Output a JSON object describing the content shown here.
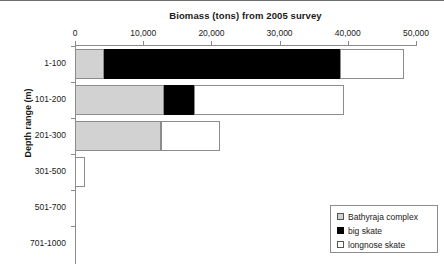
{
  "chart_data": {
    "type": "bar",
    "orientation": "horizontal",
    "stacked": true,
    "title": "Biomass (tons) from 2005 survey",
    "xlabel": "",
    "ylabel": "Depth range (m)",
    "categories": [
      "1-100",
      "101-200",
      "201-300",
      "301-500",
      "501-700",
      "701-1000"
    ],
    "xlim": [
      0,
      50000
    ],
    "xticks": [
      0,
      10000,
      20000,
      30000,
      40000,
      50000
    ],
    "xtick_labels": [
      "0",
      "10,000",
      "20,000",
      "30,000",
      "40,000",
      "50,000"
    ],
    "grid": false,
    "legend_position": "bottom-right",
    "series": [
      {
        "name": "Bathyraja complex",
        "color": "#d2d2d2",
        "values": [
          4200,
          13000,
          12600,
          0,
          0,
          0
        ]
      },
      {
        "name": "big skate",
        "color": "#000000",
        "values": [
          34700,
          4400,
          0,
          0,
          0,
          0
        ]
      },
      {
        "name": "longnose skate",
        "color": "#ffffff",
        "values": [
          9400,
          22100,
          8600,
          1500,
          0,
          0
        ]
      }
    ]
  },
  "legend": {
    "items": [
      {
        "label": "Bathyraja complex",
        "swatch": "bathyraja"
      },
      {
        "label": "big skate",
        "swatch": "big"
      },
      {
        "label": "longnose skate",
        "swatch": "longnose"
      }
    ]
  }
}
